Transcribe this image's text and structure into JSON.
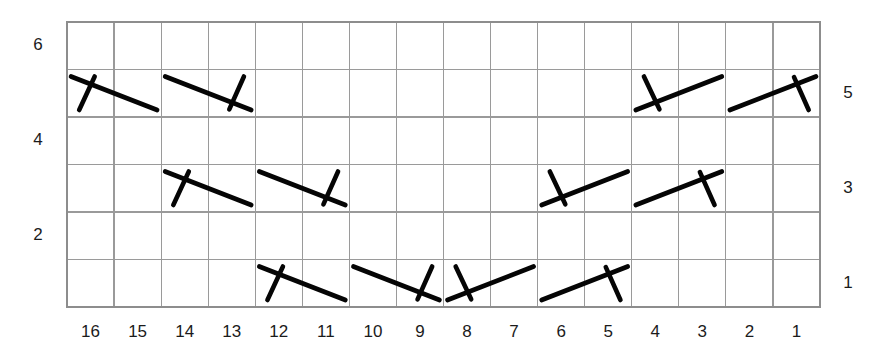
{
  "figure": {
    "title": "",
    "background_color": "#ffffff",
    "grid_color": "#9a9a9a",
    "symbol_color": "#050505"
  },
  "chart_data": {
    "type": "scatter",
    "title": "",
    "xlabel": "",
    "ylabel": "",
    "grid": true,
    "legend": "none",
    "x_axis": {
      "tick_labels": [
        "16",
        "15",
        "14",
        "13",
        "12",
        "11",
        "10",
        "9",
        "8",
        "7",
        "6",
        "5",
        "4",
        "3",
        "2",
        "1"
      ],
      "direction": "descending-left-to-right",
      "columns": 16
    },
    "y_axis_left": {
      "tick_labels": [
        "6",
        "4",
        "2"
      ],
      "rows_from_top": [
        1,
        3,
        5
      ]
    },
    "y_axis_right": {
      "tick_labels": [
        "5",
        "3",
        "1"
      ],
      "rows_from_top": [
        2,
        4,
        6
      ]
    },
    "rows": 6,
    "symbol_legend": {
      "desc-tick-left": "descending stroke with short tick below-left of upper end",
      "desc-tick-right": "descending stroke with short tick above-right of lower end",
      "asc-tick-left": "ascending stroke with short tick above-left of lower end",
      "asc-tick-right": "ascending stroke with short tick below-right of upper end"
    },
    "symbols": [
      {
        "row": 2,
        "col_start": 16,
        "col_end": 15,
        "kind": "desc-tick-left"
      },
      {
        "row": 2,
        "col_start": 14,
        "col_end": 13,
        "kind": "desc-tick-right"
      },
      {
        "row": 2,
        "col_start": 4,
        "col_end": 3,
        "kind": "asc-tick-left"
      },
      {
        "row": 2,
        "col_start": 2,
        "col_end": 1,
        "kind": "asc-tick-right"
      },
      {
        "row": 4,
        "col_start": 14,
        "col_end": 13,
        "kind": "desc-tick-left"
      },
      {
        "row": 4,
        "col_start": 12,
        "col_end": 11,
        "kind": "desc-tick-right"
      },
      {
        "row": 4,
        "col_start": 6,
        "col_end": 5,
        "kind": "asc-tick-left"
      },
      {
        "row": 4,
        "col_start": 4,
        "col_end": 3,
        "kind": "asc-tick-right"
      },
      {
        "row": 6,
        "col_start": 12,
        "col_end": 11,
        "kind": "desc-tick-left"
      },
      {
        "row": 6,
        "col_start": 10,
        "col_end": 9,
        "kind": "desc-tick-right"
      },
      {
        "row": 6,
        "col_start": 8,
        "col_end": 7,
        "kind": "asc-tick-left"
      },
      {
        "row": 6,
        "col_start": 6,
        "col_end": 5,
        "kind": "asc-tick-right"
      }
    ]
  },
  "geometry": {
    "grid_left": 67,
    "grid_right": 820,
    "grid_top": 22,
    "grid_bottom": 307,
    "cols": 16,
    "rows": 6,
    "x_tick_label_y": 333,
    "left_label_x": 38,
    "right_label_x": 848
  }
}
